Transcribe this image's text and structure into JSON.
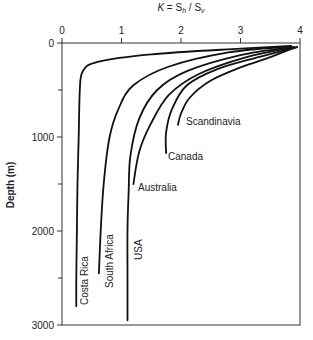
{
  "chart_data": {
    "type": "line",
    "title": "",
    "xlabel": "K = S_h / S_v",
    "xlabel_parts": {
      "k": "K",
      "eq": " = S",
      "sub_h": "h",
      "slash": " / S",
      "sub_v": "v"
    },
    "ylabel": "Depth (m)",
    "xlim": [
      0,
      4
    ],
    "ylim": [
      3000,
      0
    ],
    "x_axis_position": "top",
    "x_ticks": [
      0,
      1,
      2,
      3,
      4
    ],
    "y_ticks": [
      0,
      1000,
      2000,
      3000
    ],
    "y_minor_ticks": [
      500,
      1500,
      2500
    ],
    "grid": false,
    "legend": "inline labels",
    "series": [
      {
        "name": "Costa Rica",
        "points": [
          [
            3.85,
            30
          ],
          [
            3.0,
            60
          ],
          [
            1.5,
            120
          ],
          [
            0.6,
            200
          ],
          [
            0.35,
            300
          ],
          [
            0.3,
            500
          ],
          [
            0.28,
            1000
          ],
          [
            0.26,
            1500
          ],
          [
            0.25,
            2000
          ],
          [
            0.24,
            2500
          ],
          [
            0.24,
            2800
          ]
        ],
        "label_pos": {
          "x_px": 88,
          "y_px": 305,
          "rotate": -90
        }
      },
      {
        "name": "South Africa",
        "points": [
          [
            3.85,
            35
          ],
          [
            2.8,
            100
          ],
          [
            1.8,
            250
          ],
          [
            1.2,
            450
          ],
          [
            0.95,
            700
          ],
          [
            0.8,
            1000
          ],
          [
            0.7,
            1500
          ],
          [
            0.65,
            2000
          ],
          [
            0.62,
            2450
          ]
        ],
        "label_pos": {
          "x_px": 113,
          "y_px": 288,
          "rotate": -90
        }
      },
      {
        "name": "USA",
        "points": [
          [
            3.9,
            40
          ],
          [
            3.0,
            130
          ],
          [
            2.1,
            300
          ],
          [
            1.6,
            500
          ],
          [
            1.3,
            800
          ],
          [
            1.15,
            1200
          ],
          [
            1.12,
            1600
          ],
          [
            1.1,
            2000
          ],
          [
            1.1,
            2500
          ],
          [
            1.1,
            2950
          ]
        ],
        "label_pos": {
          "x_px": 142,
          "y_px": 260,
          "rotate": -90
        }
      },
      {
        "name": "Australia",
        "points": [
          [
            3.9,
            45
          ],
          [
            3.1,
            150
          ],
          [
            2.3,
            330
          ],
          [
            1.8,
            550
          ],
          [
            1.5,
            850
          ],
          [
            1.3,
            1150
          ],
          [
            1.2,
            1500
          ]
        ],
        "label_pos": {
          "x_px": 138,
          "y_px": 191,
          "rotate": 0
        }
      },
      {
        "name": "Canada",
        "points": [
          [
            3.95,
            45
          ],
          [
            3.3,
            150
          ],
          [
            2.6,
            280
          ],
          [
            2.1,
            450
          ],
          [
            1.85,
            700
          ],
          [
            1.75,
            950
          ],
          [
            1.75,
            1170
          ]
        ],
        "label_pos": {
          "x_px": 168,
          "y_px": 160,
          "rotate": 0
        }
      },
      {
        "name": "Scandinavia",
        "points": [
          [
            3.95,
            40
          ],
          [
            3.5,
            150
          ],
          [
            3.0,
            260
          ],
          [
            2.5,
            400
          ],
          [
            2.15,
            580
          ],
          [
            2.0,
            750
          ],
          [
            1.95,
            870
          ]
        ],
        "label_pos": {
          "x_px": 186,
          "y_px": 125,
          "rotate": 0
        }
      }
    ]
  }
}
